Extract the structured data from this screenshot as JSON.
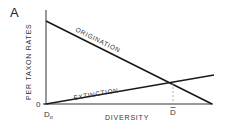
{
  "figure": {
    "panel_label": "A",
    "y_axis_label": "PER TAXON RATES",
    "x_axis_label": "DIVERSITY",
    "y_origin_label": "0",
    "x_origin_label": "D",
    "x_origin_subscript": "o",
    "equilibrium_label": "D",
    "equilibrium_accent": "ˆ",
    "lines": [
      {
        "name": "ORIGINATION",
        "label": "ORIGINATION",
        "trend": "decreasing"
      },
      {
        "name": "EXTINCTION",
        "label": "EXTINCTION",
        "trend": "increasing"
      }
    ],
    "colors": {
      "line": "#1a1a1a",
      "axis": "#333333",
      "dashed": "#999999",
      "background": "#ffffff"
    }
  }
}
